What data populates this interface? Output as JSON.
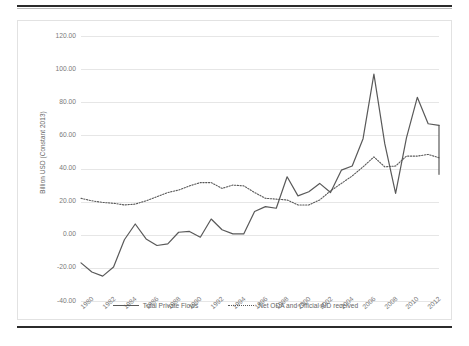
{
  "figure": {
    "y_axis_title": "Billion USD (Constant 2013)",
    "legend": [
      {
        "label": "Total Private Flows",
        "style": "solid",
        "color": "#595959"
      },
      {
        "label": "Net ODA and Official AID received",
        "style": "dotted",
        "color": "#595959"
      }
    ]
  },
  "chart_data": {
    "type": "line",
    "title": "",
    "xlabel": "",
    "ylabel": "Billion USD (Constant 2013)",
    "ylim": [
      -40,
      120
    ],
    "yticks": [
      "120.00",
      "100.00",
      "80.00",
      "60.00",
      "40.00",
      "20.00",
      "0.00",
      "-20.00",
      "-40.00"
    ],
    "ytick_values": [
      120,
      100,
      80,
      60,
      40,
      20,
      0,
      -20,
      -40
    ],
    "grid": true,
    "legend_position": "bottom",
    "xticks": [
      "1980",
      "1982",
      "1984",
      "1986",
      "1988",
      "1990",
      "1992",
      "1994",
      "1996",
      "1998",
      "2000",
      "2002",
      "2004",
      "2006",
      "2008",
      "2010",
      "2012"
    ],
    "x": [
      1980,
      1981,
      1982,
      1983,
      1984,
      1985,
      1986,
      1987,
      1988,
      1989,
      1990,
      1991,
      1992,
      1993,
      1994,
      1995,
      1996,
      1997,
      1998,
      1999,
      2000,
      2001,
      2002,
      2003,
      2004,
      2005,
      2006,
      2007,
      2008,
      2009,
      2010,
      2011,
      2012,
      2013
    ],
    "series": [
      {
        "name": "Total Private Flows",
        "style": "solid",
        "color": "#595959",
        "values": [
          -17.0,
          -22.5,
          -25.0,
          -19.5,
          -3.0,
          6.5,
          -2.5,
          -6.5,
          -5.5,
          1.5,
          2.0,
          -1.5,
          9.5,
          3.0,
          0.5,
          0.5,
          14.0,
          17.0,
          16.0,
          35.0,
          23.5,
          26.0,
          31.0,
          25.5,
          39.0,
          41.5,
          58.0,
          97.0,
          55.0,
          25.0,
          58.5,
          83.0,
          67.0,
          66.0
        ]
      },
      {
        "name": "Net ODA and Official AID received",
        "style": "dotted",
        "color": "#595959",
        "values": [
          22.0,
          20.5,
          19.5,
          19.0,
          18.0,
          18.5,
          20.5,
          23.0,
          25.5,
          27.0,
          29.5,
          31.5,
          31.5,
          28.0,
          30.0,
          29.5,
          25.5,
          22.0,
          21.5,
          21.0,
          18.0,
          18.0,
          21.0,
          26.5,
          31.0,
          35.5,
          41.0,
          47.0,
          41.0,
          41.5,
          47.5,
          47.5,
          48.5,
          46.5
        ]
      }
    ],
    "final_segment": {
      "note": "Total Private Flows falls to 36.5 at right edge of plot",
      "value": 36.5
    }
  }
}
